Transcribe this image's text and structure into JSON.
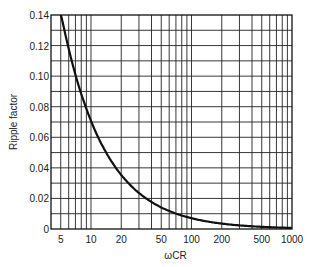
{
  "chart_data": {
    "type": "line",
    "title": "",
    "xlabel": "ωCR",
    "ylabel": "Ripple factor",
    "xscale": "log",
    "xlim": [
      4,
      1000
    ],
    "ylim": [
      0,
      0.14
    ],
    "grid": true,
    "legend": null,
    "x_ticks": [
      5,
      10,
      20,
      50,
      100,
      200,
      500,
      1000
    ],
    "x_tick_labels": [
      "5",
      "10",
      "20",
      "50",
      "100",
      "200",
      "500",
      "1000"
    ],
    "y_ticks": [
      0,
      0.02,
      0.04,
      0.06,
      0.08,
      0.1,
      0.12,
      0.14
    ],
    "y_tick_labels": [
      "0",
      "0.02",
      "0.04",
      "0.06",
      "0.08",
      "0.10",
      "0.12",
      "0.14"
    ],
    "series": [
      {
        "name": "Ripple factor",
        "x": [
          5,
          6,
          7,
          8,
          10,
          15,
          20,
          30,
          50,
          70,
          100,
          200,
          500,
          1000
        ],
        "y": [
          0.141,
          0.118,
          0.101,
          0.088,
          0.071,
          0.047,
          0.035,
          0.024,
          0.014,
          0.01,
          0.007,
          0.0035,
          0.0014,
          0.0007
        ]
      }
    ]
  },
  "labels": {
    "xlabel": "ωCR",
    "ylabel": "Ripple factor"
  }
}
